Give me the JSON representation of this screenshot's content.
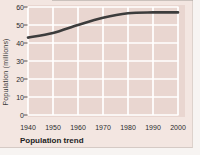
{
  "figure": {
    "caption": "Population trend",
    "y_axis_title": "Population (millions)"
  },
  "chart_data": {
    "type": "line",
    "x": [
      1940,
      1950,
      1960,
      1970,
      1980,
      1990,
      2000
    ],
    "series": [
      {
        "name": "Population",
        "values": [
          43,
          45.5,
          50,
          54,
          56.5,
          57,
          57
        ]
      }
    ],
    "title": "",
    "xlabel": "",
    "ylabel": "Population (millions)",
    "caption": "Population trend",
    "xlim": [
      1940,
      2000
    ],
    "ylim": [
      0,
      60
    ],
    "xticks": [
      1940,
      1950,
      1960,
      1970,
      1980,
      1990,
      2000
    ],
    "yticks": [
      0,
      10,
      20,
      30,
      40,
      50,
      60
    ],
    "grid": true,
    "legend": false,
    "colors": {
      "line": "#3c3c3c",
      "plot_background": "#e9d6d0",
      "figure_background": "#f3e6e1",
      "gridline": "#ffffff",
      "tick_mark": "#5a5350",
      "text": "#2b2b2b"
    }
  }
}
